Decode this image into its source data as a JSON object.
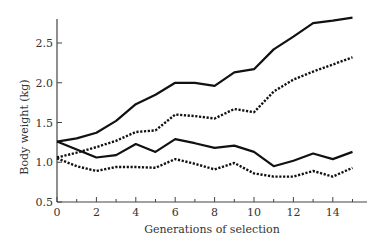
{
  "chart_data": {
    "type": "line",
    "title": "",
    "xlabel": "Generations of selection",
    "ylabel": "Body weight (kg)",
    "xlim": [
      0,
      15.5
    ],
    "ylim": [
      0.5,
      2.8
    ],
    "x_ticks_major": [
      0,
      2,
      4,
      6,
      8,
      10,
      12,
      14
    ],
    "x_ticks_minor": [
      1,
      3,
      5,
      7,
      9,
      11,
      13,
      15
    ],
    "y_ticks": [
      0.5,
      1.0,
      1.5,
      2.0,
      2.5
    ],
    "y_tick_labels": [
      "0.5",
      "1.0",
      "1.5",
      "2.0",
      "2.5"
    ],
    "x_tick_labels": [
      "0",
      "2",
      "4",
      "6",
      "8",
      "10",
      "12",
      "14"
    ],
    "grid": false,
    "legend": null,
    "x": [
      0,
      1,
      2,
      3,
      4,
      5,
      6,
      7,
      8,
      9,
      10,
      11,
      12,
      13,
      14,
      15
    ],
    "series": [
      {
        "name": "upper-solid",
        "style": "solid",
        "values": [
          1.26,
          1.3,
          1.37,
          1.52,
          1.73,
          1.85,
          2.0,
          2.0,
          1.96,
          2.13,
          2.17,
          2.42,
          2.58,
          2.75,
          2.78,
          2.82
        ]
      },
      {
        "name": "upper-dotted",
        "style": "dotted",
        "values": [
          1.06,
          1.12,
          1.19,
          1.27,
          1.38,
          1.4,
          1.6,
          1.58,
          1.55,
          1.67,
          1.63,
          1.89,
          2.04,
          2.14,
          2.23,
          2.32
        ]
      },
      {
        "name": "lower-solid",
        "style": "solid",
        "values": [
          1.26,
          1.16,
          1.06,
          1.09,
          1.23,
          1.13,
          1.29,
          1.24,
          1.18,
          1.21,
          1.13,
          0.95,
          1.02,
          1.11,
          1.04,
          1.13
        ]
      },
      {
        "name": "lower-dotted",
        "style": "dotted",
        "values": [
          1.05,
          0.95,
          0.89,
          0.94,
          0.94,
          0.93,
          1.04,
          0.98,
          0.91,
          0.99,
          0.86,
          0.82,
          0.82,
          0.89,
          0.82,
          0.93
        ]
      }
    ],
    "colors": {
      "line": "#111111",
      "axis": "#444444",
      "text": "#333333"
    }
  }
}
